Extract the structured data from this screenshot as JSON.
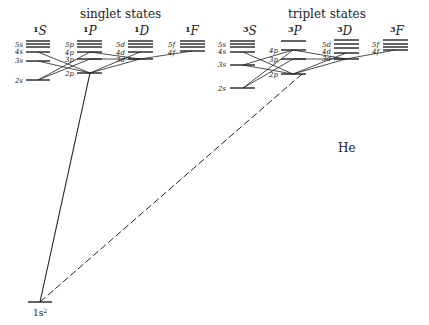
{
  "diagram": {
    "element": "He",
    "singlet": {
      "title": "singlet states",
      "terms": [
        {
          "sup": "1",
          "letter": "S",
          "levels": [
            "5s",
            "4s",
            "3s",
            "2s"
          ]
        },
        {
          "sup": "1",
          "letter": "P",
          "levels": [
            "5p",
            "4p",
            "3p",
            "2p"
          ]
        },
        {
          "sup": "1",
          "letter": "D",
          "levels": [
            "5d",
            "4d",
            "3d"
          ]
        },
        {
          "sup": "1",
          "letter": "F",
          "levels": [
            "5f",
            "4f"
          ]
        }
      ]
    },
    "triplet": {
      "title": "triplet states",
      "terms": [
        {
          "sup": "3",
          "letter": "S",
          "levels": [
            "5s",
            "4s",
            "3s",
            "2s"
          ]
        },
        {
          "sup": "3",
          "letter": "P",
          "levels": [
            "4p",
            "3p",
            "2p"
          ]
        },
        {
          "sup": "3",
          "letter": "D",
          "levels": [
            "5d",
            "4d",
            "3d"
          ]
        },
        {
          "sup": "3",
          "letter": "F",
          "levels": [
            "5f",
            "4f"
          ]
        }
      ]
    },
    "ground_state": {
      "label": "1s",
      "sup": "2"
    },
    "transitions": {
      "singlet_to_ground": "solid",
      "triplet_to_ground": "dashed"
    }
  }
}
